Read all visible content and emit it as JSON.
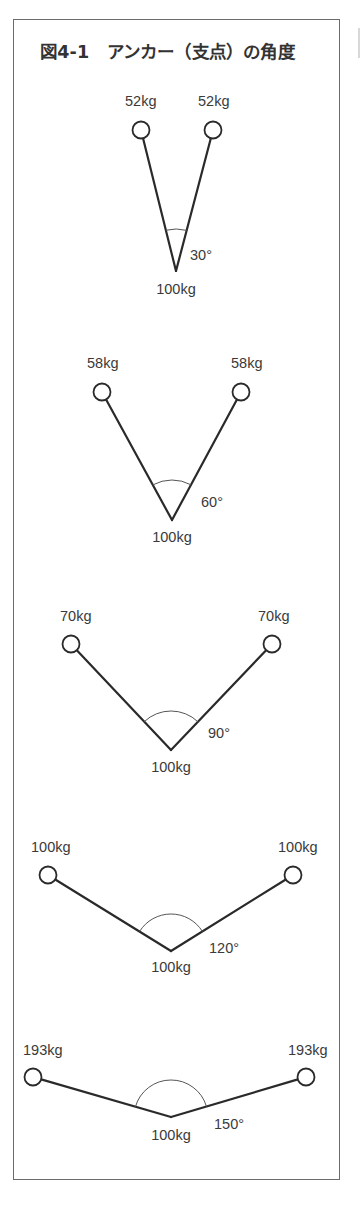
{
  "figure": {
    "title": "図4-1　アンカー（支点）の角度",
    "colors": {
      "line": "#2a2a2a",
      "arc": "#555555",
      "text": "#3a3a3a",
      "frame": "#6b6b6b"
    }
  },
  "diagrams": [
    {
      "angle_label": "30°",
      "load_label": "100kg",
      "left_label": "52kg",
      "right_label": "52kg",
      "left": [
        141,
        130
      ],
      "right": [
        213,
        130
      ],
      "apex": [
        176,
        271
      ],
      "left_label_pos": [
        125,
        106
      ],
      "right_label_pos": [
        198,
        106
      ],
      "angle_label_pos": [
        190,
        260
      ],
      "load_label_pos": [
        176,
        294
      ],
      "arc_r": 42
    },
    {
      "angle_label": "60°",
      "load_label": "100kg",
      "left_label": "58kg",
      "right_label": "58kg",
      "left": [
        102,
        392
      ],
      "right": [
        241,
        392
      ],
      "apex": [
        172,
        520
      ],
      "left_label_pos": [
        87,
        368
      ],
      "right_label_pos": [
        231,
        368
      ],
      "angle_label_pos": [
        201,
        507
      ],
      "load_label_pos": [
        172,
        542
      ],
      "arc_r": 40
    },
    {
      "angle_label": "90°",
      "load_label": "100kg",
      "left_label": "70kg",
      "right_label": "70kg",
      "left": [
        71,
        644
      ],
      "right": [
        272,
        644
      ],
      "apex": [
        171,
        750
      ],
      "left_label_pos": [
        60,
        621
      ],
      "right_label_pos": [
        258,
        621
      ],
      "angle_label_pos": [
        208,
        738
      ],
      "load_label_pos": [
        171,
        772
      ],
      "arc_r": 39
    },
    {
      "angle_label": "120°",
      "load_label": "100kg",
      "left_label": "100kg",
      "right_label": "100kg",
      "left": [
        48,
        875
      ],
      "right": [
        293,
        875
      ],
      "apex": [
        171,
        951
      ],
      "left_label_pos": [
        31,
        852
      ],
      "right_label_pos": [
        278,
        852
      ],
      "angle_label_pos": [
        209,
        953
      ],
      "load_label_pos": [
        171,
        972
      ],
      "arc_r": 37
    },
    {
      "angle_label": "150°",
      "load_label": "100kg",
      "left_label": "193kg",
      "right_label": "193kg",
      "left": [
        33,
        1077
      ],
      "right": [
        306,
        1077
      ],
      "apex": [
        171,
        1117
      ],
      "left_label_pos": [
        23,
        1055
      ],
      "right_label_pos": [
        288,
        1055
      ],
      "angle_label_pos": [
        214,
        1129
      ],
      "load_label_pos": [
        171,
        1140
      ],
      "arc_r": 37
    }
  ]
}
